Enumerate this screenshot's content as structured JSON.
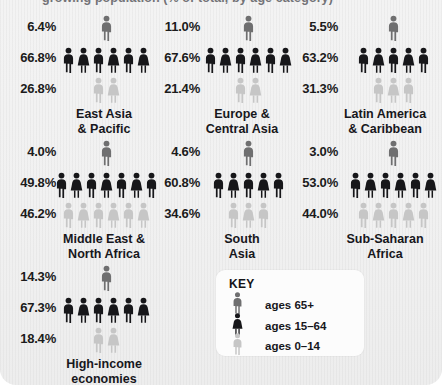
{
  "caption": "growing population (% of total, by age category)",
  "colors": {
    "age_65_plus": "#6f6f70",
    "age_15_64": "#17171a",
    "age_0_14": "#c6c6c6",
    "text": "#17171c",
    "panel_bg": "#f1f1f1",
    "key_bg": "#fcfcfc"
  },
  "key": {
    "title": "KEY",
    "items": [
      {
        "label": "ages 65+",
        "icon": "person-icon-senior",
        "color_ref": "age_65_plus"
      },
      {
        "label": "ages 15–64",
        "icon": "person-icon-adult",
        "color_ref": "age_15_64"
      },
      {
        "label": "ages 0–14",
        "icon": "person-icon-child",
        "color_ref": "age_0_14"
      }
    ]
  },
  "chart_data": {
    "type": "pictogram",
    "title": "growing population (% of total, by age category)",
    "unit": "percent of total population",
    "categories": [
      "ages 65+",
      "ages 15–64",
      "ages 0–14"
    ],
    "series": [
      {
        "name": "East Asia & Pacific",
        "label_lines": [
          "East Asia",
          "& Pacific"
        ],
        "values": [
          6.4,
          66.8,
          26.8
        ],
        "value_labels": [
          "6.4%",
          "66.8%",
          "26.8%"
        ],
        "icon_counts": [
          1,
          6,
          2
        ]
      },
      {
        "name": "Europe & Central Asia",
        "label_lines": [
          "Europe &",
          "Central Asia"
        ],
        "values": [
          11.0,
          67.6,
          21.4
        ],
        "value_labels": [
          "11.0%",
          "67.6%",
          "21.4%"
        ],
        "icon_counts": [
          1,
          6,
          2
        ]
      },
      {
        "name": "Latin America & Caribbean",
        "label_lines": [
          "Latin America",
          "& Caribbean"
        ],
        "values": [
          5.5,
          63.2,
          31.3
        ],
        "value_labels": [
          "5.5%",
          "63.2%",
          "31.3%"
        ],
        "icon_counts": [
          1,
          5,
          3
        ]
      },
      {
        "name": "Middle East & North Africa",
        "label_lines": [
          "Middle East &",
          "North Africa"
        ],
        "values": [
          4.0,
          49.8,
          46.2
        ],
        "value_labels": [
          "4.0%",
          "49.8%",
          "46.2%"
        ],
        "icon_counts": [
          1,
          7,
          6
        ]
      },
      {
        "name": "South Asia",
        "label_lines": [
          "South",
          "Asia"
        ],
        "values": [
          4.6,
          60.8,
          34.6
        ],
        "value_labels": [
          "4.6%",
          "60.8%",
          "34.6%"
        ],
        "icon_counts": [
          1,
          5,
          3
        ]
      },
      {
        "name": "Sub-Saharan Africa",
        "label_lines": [
          "Sub-Saharan",
          "Africa"
        ],
        "values": [
          3.0,
          53.0,
          44.0
        ],
        "value_labels": [
          "3.0%",
          "53.0%",
          "44.0%"
        ],
        "icon_counts": [
          1,
          6,
          5
        ]
      },
      {
        "name": "High-income economies",
        "label_lines": [
          "High-income",
          "economies"
        ],
        "values": [
          14.3,
          67.3,
          18.4
        ],
        "value_labels": [
          "14.3%",
          "67.3%",
          "18.4%"
        ],
        "icon_counts": [
          1,
          6,
          2
        ]
      }
    ],
    "legend_position": "bottom-center",
    "grid": false
  }
}
